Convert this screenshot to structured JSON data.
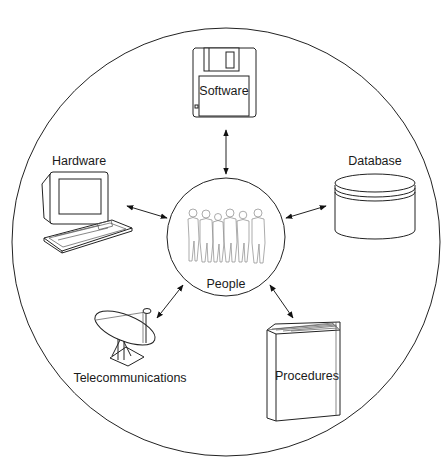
{
  "diagram": {
    "type": "hub-and-spoke",
    "center": {
      "label": "People",
      "icon": "group-of-people-icon"
    },
    "components": [
      {
        "id": "software",
        "label": "Software",
        "icon": "floppy-disk-icon",
        "position": "top"
      },
      {
        "id": "hardware",
        "label": "Hardware",
        "icon": "computer-terminal-icon",
        "position": "upper-left"
      },
      {
        "id": "database",
        "label": "Database",
        "icon": "database-cylinder-icon",
        "position": "upper-right"
      },
      {
        "id": "telecommunications",
        "label": "Telecommunications",
        "icon": "satellite-dish-icon",
        "position": "lower-left"
      },
      {
        "id": "procedures",
        "label": "Procedures",
        "icon": "book-icon",
        "position": "lower-right"
      }
    ],
    "connectors": [
      {
        "from": "People",
        "to": "Software",
        "style": "double-headed-arrow"
      },
      {
        "from": "People",
        "to": "Hardware",
        "style": "double-headed-arrow"
      },
      {
        "from": "People",
        "to": "Database",
        "style": "double-headed-arrow"
      },
      {
        "from": "People",
        "to": "Telecommunications",
        "style": "double-headed-arrow"
      },
      {
        "from": "People",
        "to": "Procedures",
        "style": "double-headed-arrow"
      }
    ],
    "colors": {
      "line": "#222222",
      "background": "#ffffff",
      "people_outline": "#777777"
    }
  }
}
